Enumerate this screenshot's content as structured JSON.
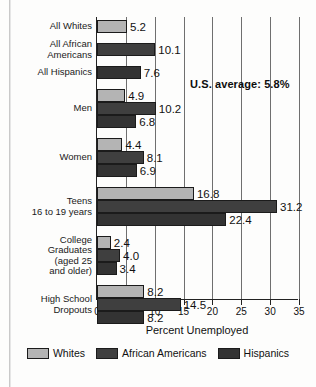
{
  "chart_data": {
    "type": "bar",
    "orientation": "horizontal",
    "title": "",
    "xlabel": "Percent Unemployed",
    "ylabel": "",
    "xlim": [
      0,
      35
    ],
    "xticks": [
      "0",
      "5",
      "10",
      "15",
      "20",
      "25",
      "30",
      "35"
    ],
    "grid": true,
    "legend_position": "bottom",
    "categories": [
      "All Whites",
      "All African Americans",
      "All Hispanics",
      "Men",
      "Women",
      "Teens 16 to 19 years",
      "College Graduates (aged 25 and older)",
      "High School Dropouts"
    ],
    "series": [
      {
        "name": "Whites",
        "color": "#b4b4b4",
        "values": [
          5.2,
          null,
          null,
          4.9,
          4.4,
          16.8,
          2.4,
          8.2
        ]
      },
      {
        "name": "African Americans",
        "color": "#3f3f3f",
        "values": [
          null,
          10.1,
          null,
          10.2,
          8.1,
          31.2,
          4.0,
          14.5
        ]
      },
      {
        "name": "Hispanics",
        "color": "#333333",
        "values": [
          null,
          null,
          7.6,
          6.8,
          6.9,
          22.4,
          3.4,
          8.2
        ]
      }
    ],
    "annotations": [
      {
        "text": "U.S. average: 5.8%",
        "value": 5.8
      }
    ]
  },
  "groups": [
    {
      "label_lines": [
        "All Whites"
      ],
      "label_name": "all-whites",
      "bars": [
        {
          "series": "whites",
          "value": 5.2,
          "label": "5.2"
        }
      ]
    },
    {
      "label_lines": [
        "All African",
        "Americans"
      ],
      "label_name": "all-african-americans",
      "bars": [
        {
          "series": "african",
          "value": 10.1,
          "label": "10.1"
        }
      ]
    },
    {
      "label_lines": [
        "All Hispanics"
      ],
      "label_name": "all-hispanics",
      "bars": [
        {
          "series": "hispanics",
          "value": 7.6,
          "label": "7.6"
        }
      ]
    },
    {
      "label_lines": [
        "Men"
      ],
      "label_name": "men",
      "bars": [
        {
          "series": "whites",
          "value": 4.9,
          "label": "4.9"
        },
        {
          "series": "african",
          "value": 10.2,
          "label": "10.2"
        },
        {
          "series": "hispanics",
          "value": 6.8,
          "label": "6.8"
        }
      ]
    },
    {
      "label_lines": [
        "Women"
      ],
      "label_name": "women",
      "bars": [
        {
          "series": "whites",
          "value": 4.4,
          "label": "4.4"
        },
        {
          "series": "african",
          "value": 8.1,
          "label": "8.1"
        },
        {
          "series": "hispanics",
          "value": 6.9,
          "label": "6.9"
        }
      ]
    },
    {
      "label_lines": [
        "Teens",
        "16 to 19 years"
      ],
      "label_name": "teens-16-to-19-years",
      "bars": [
        {
          "series": "whites",
          "value": 16.8,
          "label": "16.8"
        },
        {
          "series": "african",
          "value": 31.2,
          "label": "31.2"
        },
        {
          "series": "hispanics",
          "value": 22.4,
          "label": "22.4"
        }
      ]
    },
    {
      "label_lines": [
        "College",
        "Graduates",
        "(aged 25",
        "and older)"
      ],
      "label_name": "college-graduates",
      "bars": [
        {
          "series": "whites",
          "value": 2.4,
          "label": "2.4"
        },
        {
          "series": "african",
          "value": 4.0,
          "label": "4.0"
        },
        {
          "series": "hispanics",
          "value": 3.4,
          "label": "3.4"
        }
      ]
    },
    {
      "label_lines": [
        "High School",
        "Dropouts"
      ],
      "label_name": "high-school-dropouts",
      "bars": [
        {
          "series": "whites",
          "value": 8.2,
          "label": "8.2"
        },
        {
          "series": "african",
          "value": 14.5,
          "label": "14.5"
        },
        {
          "series": "hispanics",
          "value": 8.2,
          "label": "8.2"
        }
      ]
    }
  ],
  "axis": {
    "ticks": [
      "0",
      "5",
      "10",
      "15",
      "20",
      "25",
      "30",
      "35"
    ],
    "title": "Percent Unemployed"
  },
  "annotation": {
    "text": "U.S. average: 5.8%"
  },
  "legend": {
    "items": [
      {
        "label": "Whites",
        "series": "whites"
      },
      {
        "label": "African Americans",
        "series": "african"
      },
      {
        "label": "Hispanics",
        "series": "hispanics"
      }
    ]
  }
}
